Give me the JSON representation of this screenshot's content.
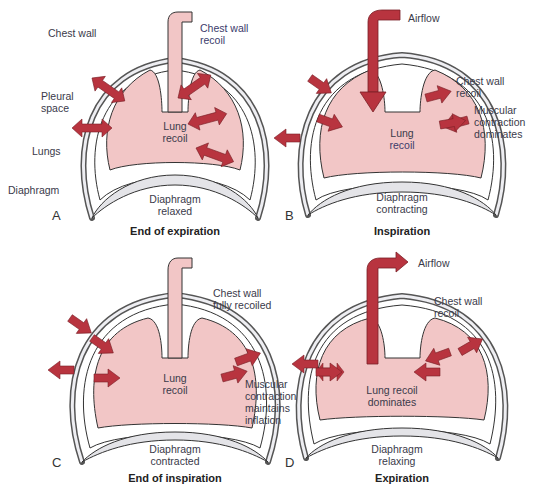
{
  "figure": {
    "panels": [
      {
        "letter": "A",
        "caption": "End of expiration",
        "center_label": "Lung\nrecoil",
        "diaphragm_label": "Diaphragm\nrelaxed",
        "labels": {
          "chest_wall": "Chest wall",
          "chest_wall_recoil": "Chest wall\nrecoil",
          "pleural_space": "Pleural\nspace",
          "lungs": "Lungs",
          "diaphragm": "Diaphragm"
        }
      },
      {
        "letter": "B",
        "caption": "Inspiration",
        "center_label_1": "Lung",
        "center_label_2": "recoil",
        "diaphragm_label": "Diaphragm\ncontracting",
        "labels": {
          "airflow": "Airflow",
          "chest_wall_recoil": "Chest wall\nrecoil",
          "muscular": "Muscular\ncontraction\ndominates"
        }
      },
      {
        "letter": "C",
        "caption": "End of inspiration",
        "center_label": "Lung\nrecoil",
        "diaphragm_label": "Diaphragm\ncontracted",
        "labels": {
          "chest_wall": "Chest wall\nfully recoiled",
          "muscular": "Muscular\ncontraction\nmaintains\ninflation"
        }
      },
      {
        "letter": "D",
        "caption": "Expiration",
        "center_label": "Lung recoil\ndominates",
        "diaphragm_label": "Diaphragm\nrelaxing",
        "labels": {
          "airflow": "Airflow",
          "chest_wall_recoil": "Chest wall\nrecoil"
        }
      }
    ],
    "colors": {
      "lung": "#f2c6c6",
      "arrow": "#b8343f",
      "wall": "#e8e8ec",
      "outline": "#333333"
    }
  }
}
